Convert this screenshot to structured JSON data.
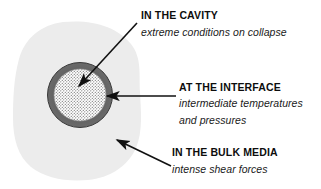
{
  "figure": {
    "type": "diagram",
    "background_color": "#ffffff",
    "blob": {
      "name": "bulk-medium-blob",
      "fill": "#ececec"
    },
    "bubble": {
      "name": "cavitation-bubble",
      "ring_color": "#585858",
      "interior_fill": "#ffffff",
      "interior_pattern": "dotted-stipple",
      "center_x": 80,
      "center_y": 95,
      "outer_radius": 33,
      "inner_radius": 26
    }
  },
  "callouts": [
    {
      "id": "cavity",
      "title": "IN THE CAVITY",
      "description": "extreme conditions on collapse",
      "arrow": {
        "name": "arrow-to-cavity",
        "from_x": 137,
        "from_y": 23,
        "to_x": 78,
        "to_y": 87
      }
    },
    {
      "id": "interface",
      "title": "AT THE INTERFACE",
      "description_line_1": "intermediate temperatures",
      "description_line_2": "and pressures",
      "arrow": {
        "name": "arrow-to-interface",
        "from_x": 176,
        "from_y": 96,
        "to_x": 106,
        "to_y": 96
      }
    },
    {
      "id": "bulk",
      "title": "IN THE BULK MEDIA",
      "description": "intense shear forces",
      "arrow": {
        "name": "arrow-to-bulk-media",
        "from_x": 171,
        "from_y": 166,
        "to_x": 116,
        "to_y": 139
      }
    }
  ]
}
